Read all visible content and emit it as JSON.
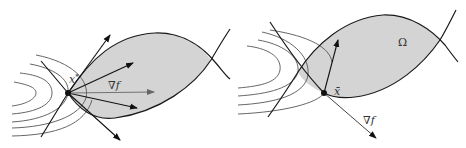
{
  "figure": {
    "panels": [
      {
        "id": "left",
        "point_label": "x*",
        "point_label_base": "x",
        "point_label_sup": "*",
        "gradient_label": "∇f",
        "region_label": ""
      },
      {
        "id": "right",
        "point_label": "x̄",
        "gradient_label": "∇f",
        "region_label": "Ω"
      }
    ],
    "colors": {
      "region_fill": "#d4d4d4",
      "boundary": "#1a1a1a",
      "contour": "#555555",
      "gradient_arrow": "#666666",
      "arrow": "#111111",
      "background": "#ffffff"
    }
  }
}
